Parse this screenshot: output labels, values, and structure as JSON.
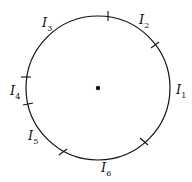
{
  "diagram": {
    "center": {
      "x": 98,
      "y": 88
    },
    "radius": 72,
    "stroke_color": "#111111",
    "tick_points": [
      {
        "x": 108,
        "y": 16
      },
      {
        "x": 155,
        "y": 45
      },
      {
        "x": 144,
        "y": 141
      },
      {
        "x": 63,
        "y": 152
      },
      {
        "x": 28,
        "y": 104
      },
      {
        "x": 26,
        "y": 77
      }
    ],
    "labels": [
      {
        "main": "I",
        "sub": "1"
      },
      {
        "main": "I",
        "sub": "2"
      },
      {
        "main": "I",
        "sub": "3"
      },
      {
        "main": "I",
        "sub": "4"
      },
      {
        "main": "I",
        "sub": "5"
      },
      {
        "main": "I",
        "sub": "6"
      }
    ]
  }
}
